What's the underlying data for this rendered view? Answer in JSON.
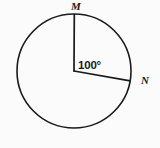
{
  "figure": {
    "type": "circle-with-central-angle",
    "background_color": "#fbfbfb",
    "stroke_color": "#1a1a1a",
    "circle": {
      "center_x": 74,
      "center_y": 71,
      "radius": 57
    },
    "points": [
      {
        "name": "M",
        "label": "M",
        "position_deg": 90,
        "x": 74,
        "y": 14,
        "label_x": 76,
        "label_y": 10
      },
      {
        "name": "N",
        "label": "N",
        "position_deg": -10,
        "x": 130,
        "y": 81,
        "label_x": 141,
        "label_y": 84
      }
    ],
    "radii": [
      {
        "name": "radius-to-m",
        "from": "center",
        "to": "M"
      },
      {
        "name": "radius-to-n",
        "from": "center",
        "to": "N"
      }
    ],
    "angle": {
      "label": "100°",
      "value": 100,
      "unit": "degrees",
      "vertex": "center",
      "between": [
        "M",
        "N"
      ],
      "label_x": 78,
      "label_y": 69
    }
  }
}
